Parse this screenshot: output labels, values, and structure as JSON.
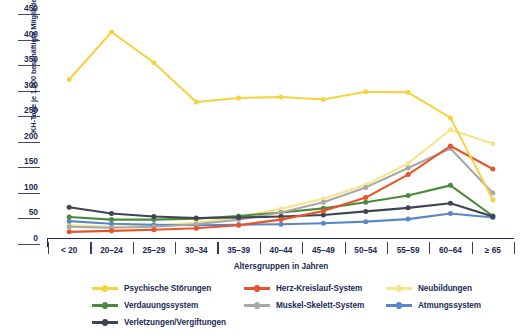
{
  "chart_data": {
    "type": "line",
    "title": "",
    "xlabel": "Altersgruppen in Jahren",
    "ylabel": "KH-Tage je 1.000 beschäftigte Mitglieder",
    "categories": [
      "< 20",
      "20–24",
      "25–29",
      "30–34",
      "35–39",
      "40–44",
      "45–49",
      "50–54",
      "55–59",
      "60–64",
      "≥ 65"
    ],
    "ylim": [
      0,
      450
    ],
    "yticks": [
      0,
      50,
      100,
      150,
      200,
      250,
      300,
      350,
      400,
      450
    ],
    "grid": false,
    "legend_position": "bottom",
    "series": [
      {
        "name": "Psychische Störungen",
        "color": "#F5D342",
        "values": [
          310,
          403,
          343,
          266,
          274,
          276,
          271,
          286,
          285,
          235,
          75
        ]
      },
      {
        "name": "Herz-Kreislauf-System",
        "color": "#E8542A",
        "values": [
          12,
          14,
          16,
          19,
          25,
          36,
          53,
          79,
          124,
          180,
          135
        ]
      },
      {
        "name": "Neubildungen",
        "color": "#F6E58C",
        "values": [
          25,
          22,
          24,
          30,
          41,
          57,
          77,
          104,
          146,
          212,
          185
        ]
      },
      {
        "name": "Verdauungssystem",
        "color": "#4A8A3C",
        "values": [
          41,
          36,
          36,
          38,
          43,
          50,
          58,
          70,
          83,
          103,
          43
        ]
      },
      {
        "name": "Muskel-Skelett-System",
        "color": "#A8A8A8",
        "values": [
          22,
          20,
          22,
          27,
          36,
          50,
          70,
          99,
          137,
          175,
          88
        ]
      },
      {
        "name": "Atmungssystem",
        "color": "#5B86C6",
        "values": [
          33,
          28,
          26,
          25,
          26,
          27,
          29,
          32,
          37,
          48,
          40
        ]
      },
      {
        "name": "Verletzungen/Vergiftungen",
        "color": "#3E4450",
        "values": [
          60,
          48,
          42,
          39,
          40,
          42,
          45,
          52,
          59,
          68,
          42
        ]
      }
    ]
  },
  "axis": {
    "color": "#1b2a55"
  }
}
